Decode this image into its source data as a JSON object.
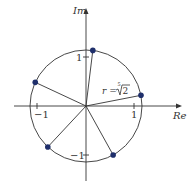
{
  "diagram": {
    "type": "complex-plane-roots",
    "axes": {
      "x_label": "Re",
      "y_label": "Im",
      "x_ticks": [
        {
          "value": -1,
          "label": "−1"
        },
        {
          "value": 1,
          "label": "1"
        }
      ],
      "y_ticks": [
        {
          "value": 1,
          "label": "1"
        },
        {
          "value": -1,
          "label": "−1"
        }
      ]
    },
    "circle": {
      "radius_label_prefix": "r = ",
      "radius_label_index": "5",
      "radius_label_radicand": "2",
      "radius_value": 1.1487
    },
    "roots": [
      {
        "angle_deg": 11
      },
      {
        "angle_deg": 83
      },
      {
        "angle_deg": 155
      },
      {
        "angle_deg": 227
      },
      {
        "angle_deg": 299
      }
    ],
    "colors": {
      "point": "#1f2f6b",
      "line": "#333333"
    }
  }
}
